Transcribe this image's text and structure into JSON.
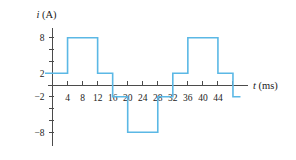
{
  "figure": {
    "kind": "waveform-plot",
    "background_color": "#ffffff",
    "line_color": "#5BB8E5",
    "axis_color": "#4b4b4b",
    "text_color": "#1b1b1b"
  },
  "chart_data": {
    "type": "line",
    "title": "",
    "subtitle": "",
    "xlabel_var": "t",
    "xlabel_unit": "(ms)",
    "ylabel_var": "i",
    "ylabel_unit": "(A)",
    "xlabel": "t (ms)",
    "ylabel": "i (A)",
    "grid": false,
    "legend": false,
    "xlim": [
      -2,
      52
    ],
    "ylim": [
      -10,
      10
    ],
    "xticks": [
      4,
      8,
      12,
      16,
      20,
      24,
      28,
      32,
      36,
      40,
      44,
      48
    ],
    "xtick_labels": [
      "4",
      "8",
      "12",
      "16",
      "20",
      "24",
      "28",
      "32",
      "36",
      "40",
      "44",
      ""
    ],
    "yticks": [
      -8,
      -6,
      -4,
      -2,
      2,
      4,
      6,
      8
    ],
    "ytick_labels": [
      "-8",
      "",
      "",
      "-2",
      "2",
      "",
      "",
      "8"
    ],
    "labeled_yticks": [
      {
        "value": 8,
        "label": "8"
      },
      {
        "value": 2,
        "label": "2"
      },
      {
        "value": -2,
        "label": "−2"
      },
      {
        "value": -8,
        "label": "−8"
      }
    ],
    "series": [
      {
        "name": "i(t)",
        "color": "#5BB8E5",
        "step": "post",
        "x": [
          -2,
          4,
          4,
          12,
          12,
          16,
          16,
          20,
          20,
          28,
          28,
          32,
          32,
          36,
          36,
          44,
          44,
          48,
          48,
          50
        ],
        "y": [
          2,
          2,
          8,
          8,
          2,
          2,
          -2,
          -2,
          -8,
          -8,
          -2,
          -2,
          2,
          2,
          8,
          8,
          2,
          2,
          -2,
          -2
        ],
        "segments": [
          {
            "from_t": -2,
            "to_t": 4,
            "value": 2
          },
          {
            "from_t": 4,
            "to_t": 12,
            "value": 8
          },
          {
            "from_t": 12,
            "to_t": 16,
            "value": 2
          },
          {
            "from_t": 16,
            "to_t": 20,
            "value": -2
          },
          {
            "from_t": 20,
            "to_t": 28,
            "value": -8
          },
          {
            "from_t": 28,
            "to_t": 32,
            "value": -2
          },
          {
            "from_t": 32,
            "to_t": 36,
            "value": 2
          },
          {
            "from_t": 36,
            "to_t": 44,
            "value": 8
          },
          {
            "from_t": 44,
            "to_t": 48,
            "value": 2
          },
          {
            "from_t": 48,
            "to_t": 50,
            "value": -2
          }
        ]
      }
    ]
  }
}
